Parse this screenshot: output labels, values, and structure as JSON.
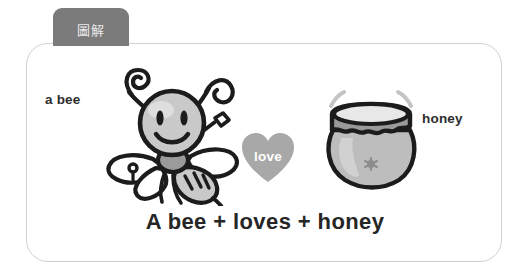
{
  "tab": {
    "label": "圖解"
  },
  "card": {
    "caption": "A bee + loves + honey",
    "figures": {
      "bee": {
        "label": "a bee",
        "icon": "bee-icon"
      },
      "heart": {
        "label": "love",
        "icon": "heart-icon"
      },
      "jar": {
        "label": "honey",
        "icon": "honey-jar-icon"
      }
    }
  },
  "colors": {
    "tab_background": "#7b7b7b",
    "tab_text": "#eaeaea",
    "card_border": "#d0d0d0",
    "card_background": "#ffffff",
    "ink": "#1c1c1c",
    "heart_fill": "#a8a8a8",
    "heart_text": "#ffffff",
    "bee_head_fill": "#c9c9c9",
    "bee_body_fill": "#9b9b9b",
    "bee_wing_fill": "#ffffff",
    "jar_fill": "#bdbdbd",
    "jar_lid_fill": "#9a9a9a",
    "caption_text": "#262626",
    "label_text": "#2d2d2d"
  }
}
